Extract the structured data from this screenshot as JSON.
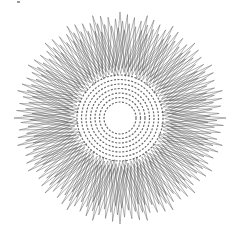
{
  "figure": {
    "center": [
      120,
      118
    ],
    "outer_radius": 106,
    "inner_hole_radius": 14,
    "points": 24,
    "layers": 9,
    "stroke_color": "#555555",
    "background": "#ffffff"
  }
}
